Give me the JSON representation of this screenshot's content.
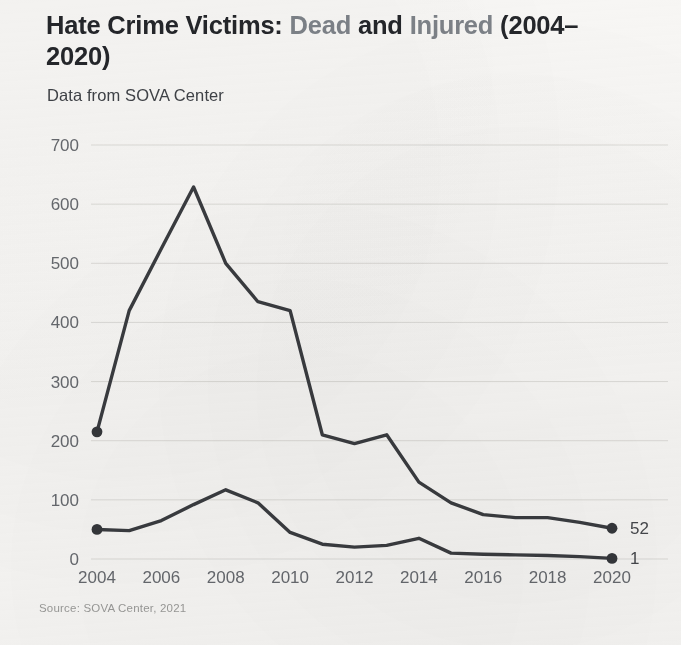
{
  "title": {
    "part1": "Hate Crime Victims: ",
    "part2": "Dead",
    "part3": " and ",
    "part4": "Injured",
    "part5": " (2004–2020)"
  },
  "subtitle": "Data from SOVA Center",
  "source": "Source: SOVA Center, 2021",
  "colors": {
    "background": "#f7f6f4",
    "line": "#3a3c40",
    "title_dark": "#24262a",
    "title_muted": "#7d8288",
    "gridline": "#dcdbd7",
    "tick_text": "#66696e"
  },
  "chart_data": {
    "type": "line",
    "title": "Hate Crime Victims: Dead and Injured (2004–2020)",
    "subtitle": "Data from SOVA Center",
    "source": "Source: SOVA Center, 2021",
    "xlabel": "",
    "ylabel": "",
    "x": [
      2004,
      2005,
      2006,
      2007,
      2008,
      2009,
      2010,
      2011,
      2012,
      2013,
      2014,
      2015,
      2016,
      2017,
      2018,
      2019,
      2020
    ],
    "xlim": [
      2004,
      2020
    ],
    "ylim": [
      0,
      700
    ],
    "yticks": [
      0,
      100,
      200,
      300,
      400,
      500,
      600,
      700
    ],
    "xticks": [
      2004,
      2006,
      2008,
      2010,
      2012,
      2014,
      2016,
      2018,
      2020
    ],
    "grid": true,
    "legend": "none",
    "series": [
      {
        "name": "Injured",
        "values": [
          215,
          420,
          525,
          629,
          500,
          435,
          420,
          210,
          195,
          210,
          130,
          95,
          75,
          70,
          70,
          62,
          52
        ],
        "end_label": "52"
      },
      {
        "name": "Dead",
        "values": [
          50,
          48,
          65,
          92,
          117,
          95,
          45,
          25,
          20,
          23,
          35,
          10,
          8,
          7,
          6,
          4,
          1
        ],
        "end_label": "1"
      }
    ],
    "annotations": [
      {
        "text": "52",
        "x": 2020,
        "y": 52
      },
      {
        "text": "1",
        "x": 2020,
        "y": 1
      }
    ]
  }
}
